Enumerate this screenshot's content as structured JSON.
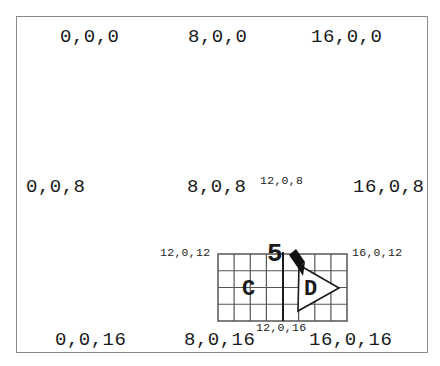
{
  "diagram": {
    "labels_large": [
      {
        "id": "0-0-0",
        "text": "0,0,0",
        "x": 60,
        "y": 28
      },
      {
        "id": "8-0-0",
        "text": "8,0,0",
        "x": 188,
        "y": 28
      },
      {
        "id": "16-0-0",
        "text": "16,0,0",
        "x": 311,
        "y": 28
      },
      {
        "id": "0-0-8",
        "text": "0,0,8",
        "x": 26,
        "y": 178
      },
      {
        "id": "8-0-8",
        "text": "8,0,8",
        "x": 187,
        "y": 178
      },
      {
        "id": "16-0-8",
        "text": "16,0,8",
        "x": 353,
        "y": 178
      },
      {
        "id": "0-0-16",
        "text": "0,0,16",
        "x": 55,
        "y": 331
      },
      {
        "id": "8-0-16",
        "text": "8,0,16",
        "x": 184,
        "y": 331
      },
      {
        "id": "16-0-16",
        "text": "16,0,16",
        "x": 309,
        "y": 331
      }
    ],
    "labels_small": [
      {
        "id": "12-0-8",
        "text": "12,0,8",
        "x": 260,
        "y": 175
      },
      {
        "id": "12-0-12",
        "text": "12,0,12",
        "x": 160,
        "y": 247
      },
      {
        "id": "16-0-12",
        "text": "16,0,12",
        "x": 352,
        "y": 247
      },
      {
        "id": "12-0-16",
        "text": "12,0,16",
        "x": 256,
        "y": 322
      }
    ],
    "grid": {
      "x": 218,
      "y": 254,
      "width": 129,
      "height": 67,
      "cols": 8,
      "rows": 4,
      "divider_x": 283
    },
    "markers": {
      "number": "5",
      "region_c": "C",
      "region_d": "D"
    },
    "colors": {
      "ink": "#1a1a1a",
      "grid_line": "#555555",
      "frame": "#8a8a8a",
      "background": "#ffffff"
    }
  }
}
